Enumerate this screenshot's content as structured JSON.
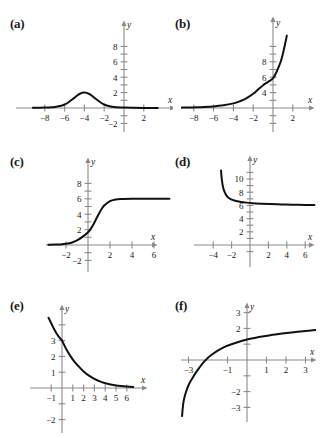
{
  "figure": {
    "kind": "multi-panel-graph-figure",
    "background": "#ffffff",
    "curve_color": "#111111",
    "axis_color": "#8a8a8a",
    "panel_labels": [
      "(a)",
      "(b)",
      "(c)",
      "(d)",
      "(e)",
      "(f)"
    ]
  },
  "chart_data": [
    {
      "id": "a",
      "panel_label": "(a)",
      "type": "line",
      "title": "",
      "xlabel": "x",
      "ylabel": "y",
      "xlim": [
        -9.2,
        3.4
      ],
      "ylim": [
        -3.0,
        9.2
      ],
      "xticks": [
        -8,
        -6,
        -4,
        -2,
        2
      ],
      "yticks": [
        2,
        4,
        6,
        8,
        -2
      ],
      "xtick_labels": [
        "-8",
        "-6",
        "-4",
        "-2",
        "2"
      ],
      "ytick_labels": [
        "2",
        "4",
        "6",
        "8",
        "-2"
      ],
      "grid": false,
      "legend": "none",
      "description": "bell-shaped bump peaking near y=2 at x=-4, flat near y=0 elsewhere",
      "x": [
        -9.2,
        -8.5,
        -8,
        -7.5,
        -7,
        -6.5,
        -6,
        -5.5,
        -5,
        -4.5,
        -4,
        -3.5,
        -3,
        -2.5,
        -2,
        -1.5,
        -1,
        0,
        1,
        2,
        3,
        3.4
      ],
      "y": [
        0.02,
        0.03,
        0.05,
        0.08,
        0.13,
        0.25,
        0.45,
        0.85,
        1.35,
        1.82,
        2.0,
        1.82,
        1.35,
        0.85,
        0.45,
        0.25,
        0.13,
        0.05,
        0.02,
        0.01,
        0.01,
        0.01
      ]
    },
    {
      "id": "b",
      "panel_label": "(b)",
      "type": "line",
      "title": "",
      "xlabel": "x",
      "ylabel": "y",
      "xlim": [
        -9.2,
        3.4
      ],
      "ylim": [
        -3.0,
        9.6
      ],
      "xticks": [
        -8,
        -6,
        -4,
        -2,
        2
      ],
      "yticks": [
        2,
        4,
        6,
        8,
        -2
      ],
      "xtick_labels": [
        "-8",
        "-6",
        "-4",
        "-2",
        "2"
      ],
      "ytick_labels": [
        "4",
        "6",
        "8"
      ],
      "grid": false,
      "legend": "none",
      "description": "exponential growth curve, near zero for x<-4, passing about (0,3.8) and rising steeply past y=9 near x=1.4",
      "x": [
        -9.2,
        -8,
        -7,
        -6,
        -5,
        -4,
        -3.5,
        -3,
        -2.5,
        -2,
        -1.5,
        -1,
        -0.5,
        0,
        0.4,
        0.8,
        1.1,
        1.4
      ],
      "y": [
        0.05,
        0.08,
        0.12,
        0.2,
        0.35,
        0.6,
        0.8,
        1.05,
        1.4,
        1.85,
        2.4,
        2.95,
        3.4,
        3.85,
        4.8,
        6.1,
        7.6,
        9.4
      ]
    },
    {
      "id": "c",
      "panel_label": "(c)",
      "type": "line",
      "title": "",
      "xlabel": "x",
      "ylabel": "y",
      "xlim": [
        -3.6,
        7.4
      ],
      "ylim": [
        -3.0,
        9.2
      ],
      "xticks": [
        -2,
        2,
        4,
        6
      ],
      "yticks": [
        2,
        4,
        6,
        8,
        -2
      ],
      "xtick_labels": [
        "-2",
        "2",
        "4",
        "6"
      ],
      "ytick_labels": [
        "2",
        "4",
        "6",
        "8",
        "-2"
      ],
      "grid": false,
      "legend": "none",
      "description": "logistic S-curve rising from 0 to horizontal asymptote y=6, passing about (0,1.6)",
      "x": [
        -3.6,
        -3,
        -2.5,
        -2,
        -1.5,
        -1,
        -0.5,
        0,
        0.25,
        0.5,
        0.75,
        1,
        1.25,
        1.5,
        2,
        2.5,
        3,
        4,
        5,
        6,
        7.4
      ],
      "y": [
        0.03,
        0.05,
        0.08,
        0.15,
        0.3,
        0.6,
        1.05,
        1.65,
        2.1,
        2.7,
        3.4,
        4.1,
        4.7,
        5.15,
        5.7,
        5.9,
        5.97,
        6.0,
        6.0,
        6.0,
        6.0
      ]
    },
    {
      "id": "d",
      "panel_label": "(d)",
      "type": "line",
      "title": "",
      "xlabel": "x",
      "ylabel": "y",
      "xlim": [
        -5.6,
        7.4
      ],
      "ylim": [
        -2.4,
        11.6
      ],
      "xticks": [
        -4,
        -2,
        2,
        4,
        6
      ],
      "yticks": [
        2,
        4,
        6,
        8,
        10
      ],
      "xtick_labels": [
        "-4",
        "-2",
        "2",
        "4",
        "6"
      ],
      "ytick_labels": [
        "2",
        "4",
        "6",
        "8",
        "10"
      ],
      "grid": false,
      "legend": "none",
      "description": "decaying curve with steep drop near x=-3.1, bending to a horizontal asymptote at y=6",
      "x": [
        -3.15,
        -3.1,
        -3.0,
        -2.9,
        -2.75,
        -2.6,
        -2.4,
        -2.1,
        -1.8,
        -1.4,
        -1.0,
        -0.4,
        0.3,
        1.2,
        2.2,
        3.4,
        4.6,
        6.0,
        7.0
      ],
      "y": [
        11.3,
        10.4,
        9.3,
        8.6,
        8.0,
        7.6,
        7.25,
        6.95,
        6.78,
        6.62,
        6.52,
        6.42,
        6.33,
        6.26,
        6.2,
        6.15,
        6.11,
        6.07,
        6.05
      ]
    },
    {
      "id": "e",
      "panel_label": "(e)",
      "type": "line",
      "title": "",
      "xlabel": "x",
      "ylabel": "y",
      "xlim": [
        -1.8,
        7.0
      ],
      "ylim": [
        -2.6,
        4.6
      ],
      "xticks": [
        -1,
        1,
        2,
        3,
        4,
        5,
        6
      ],
      "yticks": [
        1,
        2,
        3,
        -2
      ],
      "xtick_labels": [
        "-1",
        "1",
        "2",
        "3",
        "4",
        "5",
        "6"
      ],
      "ytick_labels": [
        "1",
        "2",
        "3",
        "-2"
      ],
      "grid": false,
      "legend": "none",
      "description": "exponential decay from about (0,3) toward the x-axis asymptote y=0",
      "x": [
        -1.25,
        -1.0,
        -0.75,
        -0.5,
        -0.25,
        0,
        0.4,
        0.8,
        1.2,
        1.6,
        2.0,
        2.5,
        3.0,
        3.5,
        4.0,
        4.5,
        5.0,
        5.5,
        6.0,
        6.6
      ],
      "y": [
        4.45,
        4.1,
        3.75,
        3.45,
        3.2,
        3.0,
        2.45,
        2.0,
        1.62,
        1.32,
        1.05,
        0.78,
        0.58,
        0.42,
        0.3,
        0.22,
        0.16,
        0.12,
        0.09,
        0.06
      ]
    },
    {
      "id": "f",
      "panel_label": "(f)",
      "type": "line",
      "title": "",
      "xlabel": "x",
      "ylabel": "y",
      "xlim": [
        -4.0,
        4.0
      ],
      "ylim": [
        -3.9,
        3.9
      ],
      "xticks": [
        -3,
        -1,
        1,
        2,
        3
      ],
      "yticks": [
        2,
        3,
        -2,
        -3
      ],
      "xtick_labels": [
        "-3",
        "-1",
        "1",
        "2",
        "3"
      ],
      "ytick_labels": [
        "2",
        "3",
        "-2",
        "-3"
      ],
      "grid": false,
      "legend": "none",
      "description": "logarithmic curve with vertical asymptote near x=-3.35, crossing the x-axis near x=-2.45, slowly rising to about y=1.9 at x=3.5",
      "x": [
        -3.33,
        -3.3,
        -3.25,
        -3.15,
        -3.0,
        -2.8,
        -2.6,
        -2.45,
        -2.2,
        -1.8,
        -1.2,
        -0.6,
        0,
        0.6,
        1.2,
        1.8,
        2.4,
        3.0,
        3.5
      ],
      "y": [
        -3.55,
        -3.1,
        -2.6,
        -2.1,
        -1.6,
        -1.15,
        -0.75,
        -0.5,
        -0.1,
        0.35,
        0.8,
        1.08,
        1.3,
        1.45,
        1.57,
        1.67,
        1.76,
        1.84,
        1.9
      ]
    }
  ]
}
